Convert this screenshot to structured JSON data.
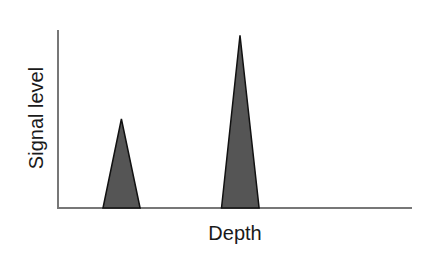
{
  "chart_data": {
    "type": "area",
    "title": "",
    "xlabel": "Depth",
    "ylabel": "Signal level",
    "grid": false,
    "legend": null,
    "x_ticks": [],
    "y_ticks": [],
    "xlim": [
      0,
      100
    ],
    "ylim": [
      0,
      100
    ],
    "series": [
      {
        "name": "peak-1",
        "shape": "triangle",
        "points": [
          [
            12.7,
            0
          ],
          [
            17.9,
            50
          ],
          [
            23.2,
            0
          ]
        ]
      },
      {
        "name": "peak-2",
        "shape": "triangle",
        "points": [
          [
            46.2,
            0
          ],
          [
            51.4,
            97
          ],
          [
            56.8,
            0
          ]
        ]
      }
    ],
    "fill_color": "#555555",
    "edge_color": "#111111",
    "axis_color": "#777777"
  },
  "labels": {
    "x": "Depth",
    "y": "Signal level"
  }
}
